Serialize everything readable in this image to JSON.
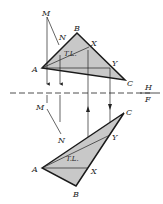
{
  "figure": {
    "fold_line": {
      "upper": "H",
      "lower": "F"
    },
    "top_view": {
      "labels": {
        "M": "M",
        "N": "N",
        "A": "A",
        "B": "B",
        "C": "C",
        "X": "X",
        "Y": "Y",
        "TL": "T.L."
      }
    },
    "front_view": {
      "labels": {
        "M": "M",
        "N": "N",
        "A": "A",
        "B": "B",
        "C": "C",
        "X": "X",
        "Y": "Y",
        "TL": "T.L."
      }
    },
    "colors": {
      "fill": "#c8c8c8",
      "line": "#1a1a1a"
    }
  }
}
